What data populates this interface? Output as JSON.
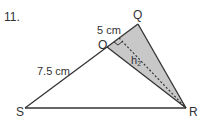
{
  "problem_number": "11.",
  "vertices": {
    "S": "S",
    "R": "R",
    "O": "O",
    "Q": "Q"
  },
  "lengths": {
    "SO": "7.5 cm",
    "OQ": "5 cm"
  },
  "height_label": "h",
  "height_subscript": "2",
  "colors": {
    "stroke": "#333333",
    "shade": "#c8c8c8"
  }
}
